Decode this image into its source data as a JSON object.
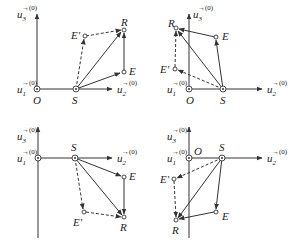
{
  "figure": {
    "panels": [
      {
        "id": "top-left",
        "labels": {
          "u3": "u",
          "u3_sub": "3",
          "u3_sup": "→(0)",
          "u1": "u",
          "u1_sub": "1",
          "u1_sup": "→(0)",
          "u2": "u",
          "u2_sub": "2",
          "u2_sup": "→(0)",
          "O": "O",
          "S": "S",
          "R": "R",
          "E": "E",
          "Ep": "E'"
        }
      },
      {
        "id": "top-right",
        "labels": {
          "u3": "u",
          "u3_sub": "3",
          "u3_sup": "→(0)",
          "u1": "u",
          "u1_sub": "1",
          "u1_sup": "→(0)",
          "u2": "u",
          "u2_sub": "2",
          "u2_sup": "→(0)",
          "O": "O",
          "S": "S",
          "R": "R",
          "E": "E",
          "Ep": "E'"
        }
      },
      {
        "id": "bottom-left",
        "labels": {
          "u3": "u",
          "u3_sub": "3",
          "u3_sup": "→(0)",
          "u1": "u",
          "u1_sub": "1",
          "u1_sup": "→(0)",
          "u2": "u",
          "u2_sub": "2",
          "u2_sup": "→(0)",
          "S": "S",
          "R": "R",
          "E": "E",
          "Ep": "E'"
        }
      },
      {
        "id": "bottom-right",
        "labels": {
          "u3": "u",
          "u3_sub": "3",
          "u3_sup": "→(0)",
          "u1": "u",
          "u1_sub": "1",
          "u1_sup": "→(0)",
          "u2": "u",
          "u2_sub": "2",
          "u2_sup": "→(0)",
          "O": "O",
          "S": "S",
          "R": "R",
          "E": "E",
          "Ep": "E'"
        }
      }
    ]
  }
}
